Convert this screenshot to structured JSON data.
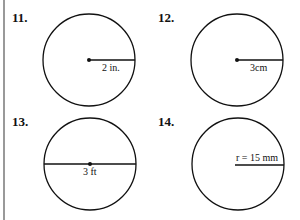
{
  "problems": [
    {
      "number": "11.",
      "label": "2 in.",
      "type": "radius"
    },
    {
      "number": "12.",
      "label": "3cm",
      "type": "radius"
    },
    {
      "number": "13.",
      "label": "3 ft",
      "type": "diameter"
    },
    {
      "number": "14.",
      "label": "r = 15 mm",
      "type": "radius"
    }
  ]
}
